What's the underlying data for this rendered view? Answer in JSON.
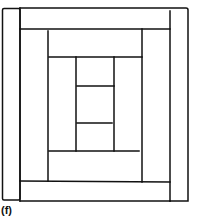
{
  "figure": {
    "label": "(f)",
    "stroke_color": "#111111",
    "background": "#ffffff"
  },
  "pieces": [
    {
      "name": "center-top",
      "x": 76,
      "y": 57,
      "w": 38,
      "h": 29
    },
    {
      "name": "center-middle",
      "x": 76,
      "y": 86,
      "w": 38,
      "h": 37
    },
    {
      "name": "center-bottom",
      "x": 76,
      "y": 123,
      "w": 38,
      "h": 28
    },
    {
      "name": "ring1-left",
      "x": 48,
      "y": 57,
      "w": 28,
      "h": 94
    },
    {
      "name": "ring1-right",
      "x": 114,
      "y": 57,
      "w": 28,
      "h": 94
    },
    {
      "name": "ring2-top",
      "x": 48,
      "y": 29,
      "w": 94,
      "h": 28
    },
    {
      "name": "ring2-bottom",
      "x": 48,
      "y": 151,
      "w": 94,
      "h": 30
    },
    {
      "name": "ring3-left",
      "x": 20,
      "y": 29,
      "w": 28,
      "h": 152
    },
    {
      "name": "ring3-right",
      "x": 142,
      "y": 29,
      "w": 28,
      "h": 152
    },
    {
      "name": "ring4-top",
      "x": 20,
      "y": 8,
      "w": 150,
      "h": 21
    },
    {
      "name": "ring4-bottom",
      "x": 20,
      "y": 181,
      "w": 150,
      "h": 20
    },
    {
      "name": "ring5-left",
      "x": 2,
      "y": 8,
      "w": 18,
      "h": 192
    },
    {
      "name": "ring5-right",
      "x": 170,
      "y": 10,
      "w": 18,
      "h": 191
    }
  ]
}
